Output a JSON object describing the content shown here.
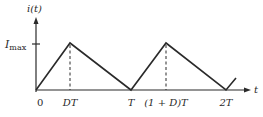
{
  "diagram": {
    "type": "sawtooth-current-waveform",
    "y_axis_label": "i(t)",
    "x_axis_label": "t",
    "y_tick_label_main": "I",
    "y_tick_label_sub": "max",
    "x_ticks": [
      {
        "label": "0",
        "t": "0"
      },
      {
        "label": "DT",
        "t": "DT"
      },
      {
        "label": "T",
        "t": "T"
      },
      {
        "label": "(1 + D)T",
        "t": "(1+D)T"
      },
      {
        "label": "2T",
        "t": "2T"
      }
    ],
    "waveform_points": [
      {
        "t": "0",
        "i": "0"
      },
      {
        "t": "DT",
        "i": "I_max"
      },
      {
        "t": "T",
        "i": "0"
      },
      {
        "t": "(1+D)T",
        "i": "I_max"
      },
      {
        "t": "2T",
        "i": "0"
      },
      {
        "t": "2T+",
        "i": "rising"
      }
    ],
    "dashed_guides_at": [
      "DT",
      "(1+D)T"
    ],
    "colors": {
      "line": "#2a2a2a",
      "background": "#ffffff"
    }
  }
}
